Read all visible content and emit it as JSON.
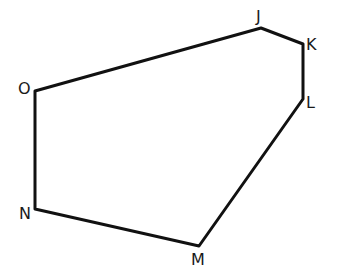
{
  "diagram": {
    "type": "polygon",
    "stroke_color": "#111111",
    "background": "#ffffff",
    "vertices": [
      {
        "label": "J",
        "x": 261,
        "y": 28,
        "lx": 256,
        "ly": 22
      },
      {
        "label": "K",
        "x": 303,
        "y": 44,
        "lx": 306,
        "ly": 50
      },
      {
        "label": "L",
        "x": 303,
        "y": 99,
        "lx": 306,
        "ly": 108
      },
      {
        "label": "M",
        "x": 199,
        "y": 246,
        "lx": 191,
        "ly": 265
      },
      {
        "label": "N",
        "x": 35,
        "y": 209,
        "lx": 19,
        "ly": 219
      },
      {
        "label": "O",
        "x": 35,
        "y": 91,
        "lx": 18,
        "ly": 94
      }
    ],
    "edges": [
      [
        "J",
        "K"
      ],
      [
        "K",
        "L"
      ],
      [
        "L",
        "M"
      ],
      [
        "M",
        "N"
      ],
      [
        "N",
        "O"
      ],
      [
        "O",
        "J"
      ]
    ]
  }
}
